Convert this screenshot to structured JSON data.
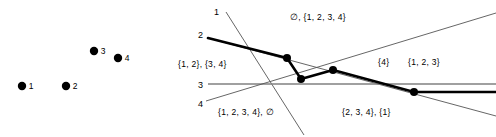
{
  "figure": {
    "background": "#ffffff",
    "ink": "#000000",
    "thin_line_color": "#555555",
    "line3_color": "#808080"
  },
  "left_panel": {
    "name": "point-set-panel",
    "points": [
      {
        "id": "1",
        "label": "1",
        "x": 22,
        "y": 86,
        "r": 4.2
      },
      {
        "id": "2",
        "label": "2",
        "x": 66,
        "y": 86,
        "r": 4.2
      },
      {
        "id": "3",
        "label": "3",
        "x": 94,
        "y": 51,
        "r": 4.2
      },
      {
        "id": "4",
        "label": "4",
        "x": 118,
        "y": 58,
        "r": 4.2
      }
    ]
  },
  "right_panel": {
    "name": "dual-line-arrangement-panel",
    "line_labels": [
      {
        "id": "1",
        "label": "1",
        "x": 44,
        "y": 8
      },
      {
        "id": "2",
        "label": "2",
        "x": 28,
        "y": 31
      },
      {
        "id": "3",
        "label": "3",
        "x": 28,
        "y": 81
      },
      {
        "id": "4",
        "label": "4",
        "x": 28,
        "y": 100
      }
    ],
    "face_labels": [
      {
        "id": "top",
        "text": "∅,  {1, 2, 3, 4}",
        "x": 120,
        "y": 13
      },
      {
        "id": "left",
        "text": "{1, 2},  {3, 4}",
        "x": 8,
        "y": 60
      },
      {
        "id": "right-small",
        "text": "{4}",
        "x": 208,
        "y": 58
      },
      {
        "id": "right-large",
        "text": "{1, 2, 3}",
        "x": 238,
        "y": 58
      },
      {
        "id": "bottom-left",
        "text": "{1, 2, 3, 4},  ∅",
        "x": 48,
        "y": 108
      },
      {
        "id": "bottom-right",
        "text": "{2, 3, 4},  {1}",
        "x": 172,
        "y": 108
      }
    ],
    "lines": [
      {
        "id": "line-1",
        "x1": 56,
        "y1": 12,
        "x2": 134,
        "y2": 135,
        "weight": "thin"
      },
      {
        "id": "line-2",
        "x1": 38,
        "y1": 38,
        "x2": 326,
        "y2": 116,
        "weight": "bold-partial"
      },
      {
        "id": "line-3",
        "x1": 38,
        "y1": 84,
        "x2": 326,
        "y2": 84,
        "weight": "thin-gray"
      },
      {
        "id": "line-4",
        "x1": 36,
        "y1": 101,
        "x2": 326,
        "y2": 13,
        "weight": "thin"
      }
    ],
    "envelope": {
      "id": "upper-envelope",
      "vertices": [
        {
          "x": 38,
          "y": 38
        },
        {
          "x": 117,
          "y": 58
        },
        {
          "x": 131,
          "y": 79
        },
        {
          "x": 163,
          "y": 70
        },
        {
          "x": 244,
          "y": 92
        },
        {
          "x": 326,
          "y": 92
        }
      ],
      "marked_vertices": [
        {
          "x": 117,
          "y": 58
        },
        {
          "x": 131,
          "y": 79
        },
        {
          "x": 163,
          "y": 70
        },
        {
          "x": 244,
          "y": 92
        }
      ],
      "dot_radius": 4.0
    }
  }
}
